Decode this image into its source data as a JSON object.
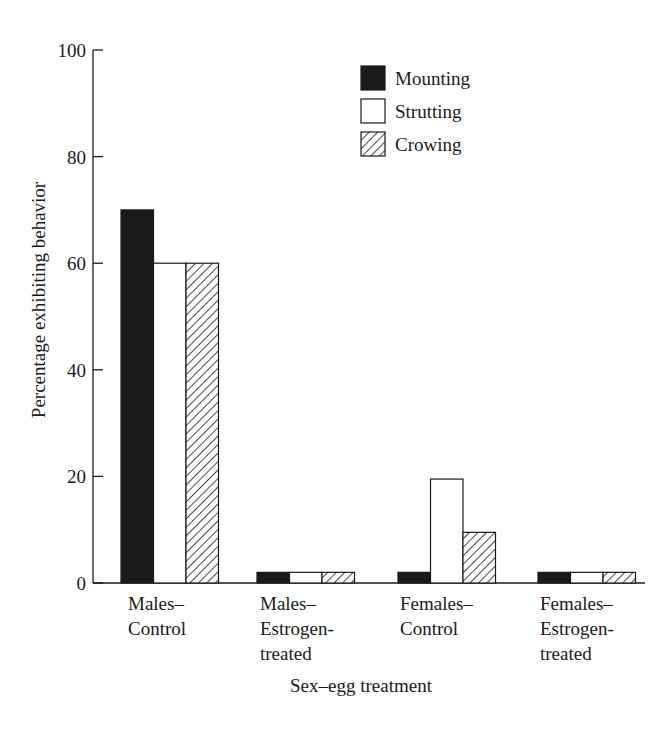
{
  "chart_data": {
    "type": "bar",
    "title": "",
    "xlabel": "Sex–egg treatment",
    "ylabel": "Percentage exhibiting behavior",
    "ylim": [
      0,
      100
    ],
    "yticks": [
      0,
      20,
      40,
      60,
      80,
      100
    ],
    "grid": false,
    "legend_position": "upper-right-inside",
    "categories": [
      [
        "Males–",
        "Control"
      ],
      [
        "Males–",
        "Estrogen-",
        "treated"
      ],
      [
        "Females–",
        "Control"
      ],
      [
        "Females–",
        "Estrogen-",
        "treated"
      ]
    ],
    "category_names": [
      "Males–Control",
      "Males–Estrogen-treated",
      "Females–Control",
      "Females–Estrogen-treated"
    ],
    "series": [
      {
        "name": "Mounting",
        "fill": "black",
        "values": [
          70,
          2,
          2,
          2
        ]
      },
      {
        "name": "Strutting",
        "fill": "white",
        "values": [
          60,
          2,
          19.5,
          2
        ]
      },
      {
        "name": "Crowing",
        "fill": "hatched",
        "values": [
          60,
          2,
          9.5,
          2
        ]
      }
    ]
  },
  "colors": {
    "ink": "#1a1a1a",
    "background": "#ffffff"
  }
}
